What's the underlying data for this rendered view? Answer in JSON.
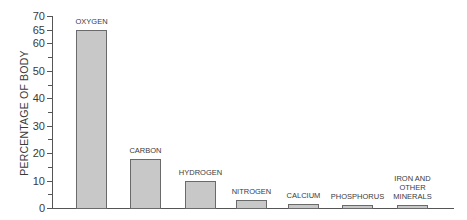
{
  "chart_data": {
    "type": "bar",
    "title": "",
    "xlabel": "",
    "ylabel": "PERCENTAGE OF BODY",
    "ylim": [
      0,
      70
    ],
    "yticks": [
      {
        "value": 0,
        "label": "0"
      },
      {
        "value": 10,
        "label": "10"
      },
      {
        "value": 20,
        "label": "20"
      },
      {
        "value": 30,
        "label": "30"
      },
      {
        "value": 40,
        "label": "40"
      },
      {
        "value": 50,
        "label": "50"
      },
      {
        "value": 60,
        "label": "60"
      },
      {
        "value": 65,
        "label": "65"
      },
      {
        "value": 70,
        "label": "70"
      }
    ],
    "minor_ticks": [
      5,
      15,
      25,
      35,
      45,
      55
    ],
    "grid": false,
    "legend": null,
    "categories": [
      "OXYGEN",
      "CARBON",
      "HYDROGEN",
      "NITROGEN",
      "CALCIUM",
      "PHOSPHORUS",
      "IRON AND\nOTHER\nMINERALS"
    ],
    "values": [
      65,
      18,
      10,
      3,
      1.5,
      1,
      1
    ],
    "bar_color": "#c8c8c8",
    "bar_edge_color": "#6a6a6a"
  }
}
